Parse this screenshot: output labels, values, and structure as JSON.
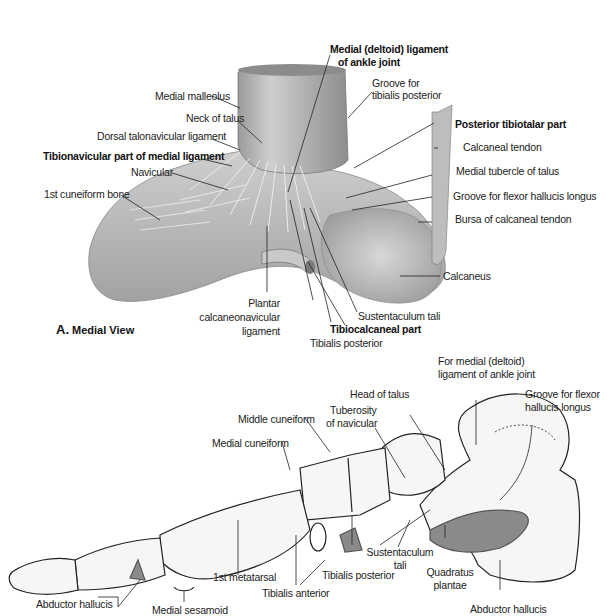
{
  "figure_a": {
    "caption_letter": "A.",
    "caption_title": "Medial View",
    "labels": {
      "deltoid_1": "Medial (deltoid) ligament",
      "deltoid_2": "of ankle joint",
      "groove_tp_1": "Groove for",
      "groove_tp_2": "tibialis posterior",
      "medial_malleolus": "Medial malleolus",
      "neck_of_talus": "Neck of talus",
      "dorsal_talonavicular": "Dorsal talonavicular ligament",
      "tibionavicular": "Tibionavicular part of medial ligament",
      "navicular": "Navicular",
      "first_cuneiform": "1st cuneiform bone",
      "posterior_tibiotalar": "Posterior tibiotalar part",
      "calcaneal_tendon": "Calcaneal tendon",
      "medial_tubercle": "Medial tubercle of talus",
      "groove_fhl": "Groove for flexor hallucis longus",
      "bursa": "Bursa of calcaneal tendon",
      "calcaneus": "Calcaneus",
      "plantar_1": "Plantar",
      "plantar_2": "calcaneonavicular",
      "plantar_3": "ligament",
      "sustentaculum": "Sustentaculum tali",
      "tibiocalcaneal": "Tibiocalcaneal part",
      "tibialis_posterior": "Tibialis posterior"
    }
  },
  "figure_b": {
    "labels": {
      "for_deltoid_1": "For medial (deltoid)",
      "for_deltoid_2": "ligament of ankle joint",
      "head_of_talus": "Head of talus",
      "groove_fhl_1": "Groove for flexor",
      "groove_fhl_2": "hallucis longus",
      "tuberosity_1": "Tuberosity",
      "tuberosity_2": "of navicular",
      "middle_cuneiform": "Middle cuneiform",
      "medial_cuneiform": "Medial cuneiform",
      "sustentaculum_1": "Sustentaculum",
      "sustentaculum_2": "tali",
      "quadratus_1": "Quadratus",
      "quadratus_2": "plantae",
      "first_metatarsal": "1st metatarsal",
      "tibialis_posterior": "Tibialis posterior",
      "tibialis_anterior": "Tibialis anterior",
      "abductor_hallucis_left": "Abductor hallucis",
      "medial_sesamoid": "Medial sesamoid",
      "abductor_hallucis_right": "Abductor hallucis"
    }
  },
  "colors": {
    "line": "#222222",
    "bone_fill": "#f4f4f2",
    "muscle_attachment": "#8a8a8a",
    "ligament_shade": "#bdbdbd"
  }
}
